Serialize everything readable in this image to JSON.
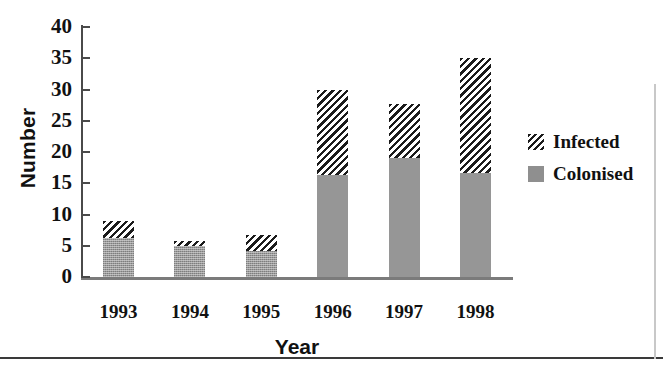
{
  "chart_data": {
    "type": "bar",
    "subtype": "stacked",
    "title": "",
    "xlabel": "Year",
    "ylabel": "Number",
    "categories": [
      "1993",
      "1994",
      "1995",
      "1996",
      "1997",
      "1998"
    ],
    "series": [
      {
        "name": "Colonised",
        "values": [
          6.3,
          5.0,
          4.2,
          16.4,
          19.1,
          16.6
        ]
      },
      {
        "name": "Infected",
        "values": [
          2.7,
          0.7,
          2.6,
          13.6,
          8.6,
          18.4
        ]
      }
    ],
    "totals": [
      9.0,
      5.7,
      6.8,
      30.0,
      27.7,
      35.0
    ],
    "ylim": [
      0,
      40
    ],
    "yticks": [
      0,
      5,
      10,
      15,
      20,
      25,
      30,
      35,
      40
    ],
    "ytick_labels": [
      "0",
      "5",
      "10",
      "15",
      "20",
      "25",
      "30",
      "35",
      "40"
    ],
    "grid": false,
    "legend_position": "right",
    "legend": [
      "Infected",
      "Colonised"
    ],
    "colors": {
      "colonised": "#969696",
      "infected_hatch": "#1b1b1b",
      "infected_background": "#ffffff",
      "axis": "#4a4a4a",
      "text": "#111111"
    }
  },
  "legend": {
    "items": [
      {
        "label": "Infected",
        "swatch": "diagonal-hatch-swatch"
      },
      {
        "label": "Colonised",
        "swatch": "solid-gray-swatch"
      }
    ]
  }
}
